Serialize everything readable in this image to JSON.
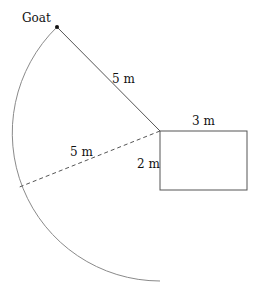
{
  "labels": {
    "goat": "Goat",
    "rope_length": "5 m",
    "radius_length": "5 m",
    "shed_width": "3 m",
    "shed_height": "2 m"
  },
  "geometry": {
    "shed_corner": [
      160,
      131
    ],
    "shed_size": [
      87,
      59
    ],
    "goat_position": [
      57,
      27
    ],
    "arc_radius": 148,
    "arc_end": [
      160,
      281
    ],
    "dashed_end": [
      17,
      188
    ]
  },
  "colors": {
    "line": "#555555",
    "arc": "#888888",
    "text": "#111111"
  }
}
